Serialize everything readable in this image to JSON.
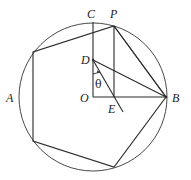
{
  "diagram": {
    "circle": {
      "center": [
        93,
        97
      ],
      "radius": 74
    },
    "points": {
      "C": {
        "label": "C",
        "pos": [
          93,
          22
        ],
        "label_pos": [
          87,
          18
        ]
      },
      "P": {
        "label": "P",
        "pos": [
          114,
          26
        ],
        "label_pos": [
          110,
          18
        ]
      },
      "D": {
        "label": "D",
        "pos": [
          93,
          60
        ],
        "label_pos": [
          81,
          64
        ]
      },
      "O": {
        "label": "O",
        "pos": [
          93,
          97
        ],
        "label_pos": [
          80,
          102
        ]
      },
      "E": {
        "label": "E",
        "pos": [
          114,
          97
        ],
        "label_pos": [
          108,
          113
        ]
      },
      "B": {
        "label": "B",
        "pos": [
          166,
          97
        ],
        "label_pos": [
          172,
          102
        ]
      },
      "A": {
        "label": "A",
        "pos": [
          19,
          97
        ],
        "label_pos": [
          6,
          102
        ]
      }
    },
    "angle_label": {
      "text": "θ",
      "pos": [
        95,
        88
      ]
    },
    "pentagon": [
      [
        114,
        26
      ],
      [
        166,
        97
      ],
      [
        114,
        167
      ],
      [
        33,
        141
      ],
      [
        33,
        52
      ]
    ],
    "segments": [
      {
        "name": "OC",
        "from": [
          93,
          97
        ],
        "to": [
          93,
          22
        ]
      },
      {
        "name": "OB",
        "from": [
          93,
          97
        ],
        "to": [
          166,
          97
        ]
      },
      {
        "name": "PE",
        "from": [
          114,
          26
        ],
        "to": [
          114,
          97
        ]
      },
      {
        "name": "DB",
        "from": [
          93,
          60
        ],
        "to": [
          166,
          97
        ]
      },
      {
        "name": "PB",
        "from": [
          114,
          26
        ],
        "to": [
          166,
          97
        ]
      },
      {
        "name": "D-E-extended",
        "from": [
          93,
          60
        ],
        "to": [
          123,
          112
        ]
      }
    ]
  }
}
